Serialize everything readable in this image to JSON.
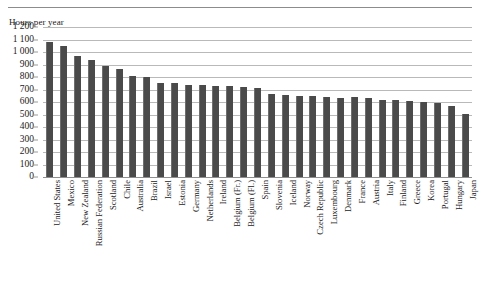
{
  "chart_data": {
    "type": "bar",
    "title": "",
    "ylabel": "Hours per year",
    "xlabel": "",
    "ylim": [
      0,
      1200
    ],
    "ytick_step": 100,
    "grid": true,
    "legend": "none",
    "bar_color": "#4a4a4a",
    "ytick_labels": [
      "1 200",
      "1 100",
      "1 000",
      "900",
      "800",
      "700",
      "600",
      "500",
      "400",
      "300",
      "200",
      "100",
      "0"
    ],
    "yticks": [
      1200,
      1100,
      1000,
      900,
      800,
      700,
      600,
      500,
      400,
      300,
      200,
      100,
      0
    ],
    "categories": [
      "United States",
      "Mexico",
      "New Zealand",
      "Russian Federation",
      "Scotland",
      "Chile",
      "Australia",
      "Brazil",
      "Israel",
      "Estonia",
      "Germany",
      "Netherlands",
      "Ireland",
      "Belgium (Fr.)",
      "Belgium (Fl.)",
      "Spain",
      "Slovenia",
      "Iceland",
      "Norway",
      "Czech Republic",
      "Luxembourg",
      "Denmark",
      "France",
      "Austria",
      "Italy",
      "Finland",
      "Greece",
      "Korea",
      "Portugal",
      "Hungary",
      "Japan"
    ],
    "values": [
      1080,
      1047,
      970,
      940,
      890,
      865,
      810,
      800,
      755,
      750,
      740,
      735,
      730,
      725,
      720,
      710,
      665,
      655,
      650,
      645,
      640,
      635,
      640,
      630,
      620,
      615,
      605,
      600,
      590,
      570,
      505
    ]
  },
  "footer": {}
}
